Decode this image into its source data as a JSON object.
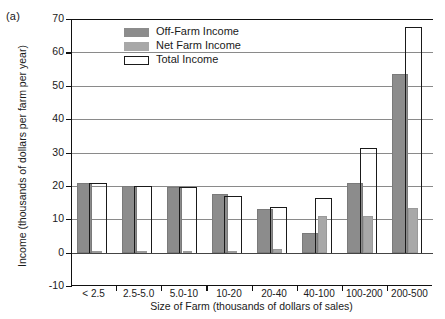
{
  "figure": {
    "panel_label": "(a)"
  },
  "chart_data": {
    "type": "bar",
    "title": "",
    "xlabel": "Size of Farm (thousands of dollars of sales)",
    "ylabel": "Income (thousands of dollars per farm per year)",
    "categories": [
      "< 2.5",
      "2.5-5.0",
      "5.0-10",
      "10-20",
      "20-40",
      "40-100",
      "100-200",
      "200-500"
    ],
    "series": [
      {
        "name": "Off-Farm Income",
        "color": "#8c8c8c",
        "values": [
          21.0,
          20.0,
          19.8,
          17.5,
          13.0,
          6.0,
          21.0,
          53.5
        ]
      },
      {
        "name": "Net Farm Income",
        "color": "#a8a8a8",
        "values": [
          0.5,
          0.4,
          0.4,
          0.5,
          1.0,
          11.0,
          11.0,
          13.5
        ]
      },
      {
        "name": "Total Income",
        "color": "#ffffff",
        "values": [
          21.0,
          20.0,
          19.8,
          17.0,
          13.8,
          16.5,
          31.5,
          67.5
        ]
      }
    ],
    "ylim": [
      -10,
      70
    ],
    "yticks": [
      -10,
      0,
      10,
      20,
      30,
      40,
      50,
      60,
      70
    ],
    "grid": true,
    "legend_position": "upper-left-inside"
  }
}
